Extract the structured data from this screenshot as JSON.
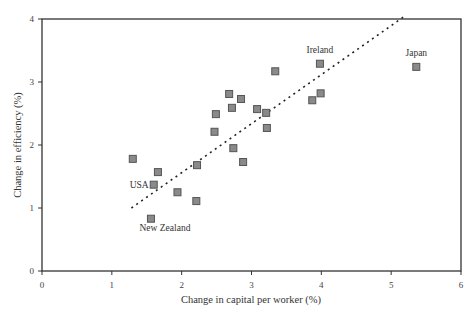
{
  "chart_data": {
    "type": "scatter",
    "title": "",
    "xlabel": "Change in capital per worker (%)",
    "ylabel": "Change in efficiency (%)",
    "xlim": [
      0,
      6
    ],
    "ylim": [
      0,
      4
    ],
    "xticks": [
      0,
      1,
      2,
      3,
      4,
      5,
      6
    ],
    "yticks": [
      0,
      1,
      2,
      3,
      4
    ],
    "grid": false,
    "legend": null,
    "points": [
      {
        "x": 1.3,
        "y": 1.78,
        "label": ""
      },
      {
        "x": 1.66,
        "y": 1.57,
        "label": ""
      },
      {
        "x": 1.6,
        "y": 1.37,
        "label": "USA"
      },
      {
        "x": 1.94,
        "y": 1.25,
        "label": ""
      },
      {
        "x": 2.21,
        "y": 1.11,
        "label": ""
      },
      {
        "x": 2.22,
        "y": 1.68,
        "label": ""
      },
      {
        "x": 1.56,
        "y": 0.83,
        "label": "New Zealand"
      },
      {
        "x": 2.68,
        "y": 2.81,
        "label": ""
      },
      {
        "x": 2.85,
        "y": 2.73,
        "label": ""
      },
      {
        "x": 2.72,
        "y": 2.59,
        "label": ""
      },
      {
        "x": 3.08,
        "y": 2.57,
        "label": ""
      },
      {
        "x": 3.21,
        "y": 2.51,
        "label": ""
      },
      {
        "x": 2.49,
        "y": 2.49,
        "label": ""
      },
      {
        "x": 3.22,
        "y": 2.27,
        "label": ""
      },
      {
        "x": 2.47,
        "y": 2.21,
        "label": ""
      },
      {
        "x": 2.74,
        "y": 1.95,
        "label": ""
      },
      {
        "x": 2.88,
        "y": 1.73,
        "label": ""
      },
      {
        "x": 3.34,
        "y": 3.17,
        "label": ""
      },
      {
        "x": 3.98,
        "y": 3.29,
        "label": "Ireland"
      },
      {
        "x": 3.87,
        "y": 2.71,
        "label": ""
      },
      {
        "x": 3.99,
        "y": 2.82,
        "label": ""
      },
      {
        "x": 5.36,
        "y": 3.24,
        "label": "Japan"
      }
    ],
    "trendline": {
      "style": "dotted",
      "from": {
        "x": 1.28,
        "y": 1.0
      },
      "to": {
        "x": 5.2,
        "y": 4.05
      }
    }
  },
  "labels": {
    "xlabel": "Change in capital per worker (%)",
    "ylabel": "Change in efficiency (%)"
  }
}
